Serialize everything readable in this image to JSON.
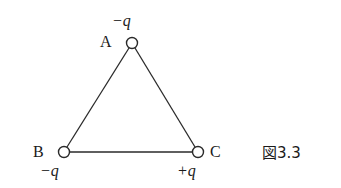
{
  "figure": {
    "caption": "図3.3",
    "nodes": [
      {
        "id": "A",
        "label": "A",
        "charge": "−q",
        "cx": 132,
        "cy": 43
      },
      {
        "id": "B",
        "label": "B",
        "charge": "−q",
        "cx": 64,
        "cy": 152
      },
      {
        "id": "C",
        "label": "C",
        "charge": "+q",
        "cx": 198,
        "cy": 152
      }
    ],
    "edges": [
      [
        "A",
        "B"
      ],
      [
        "A",
        "C"
      ],
      [
        "B",
        "C"
      ]
    ],
    "colors": {
      "stroke": "#2a2a2a",
      "text": "#1a1a1a",
      "background": "#ffffff"
    }
  }
}
